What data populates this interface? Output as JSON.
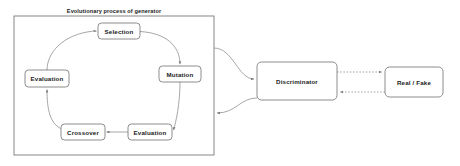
{
  "diagram": {
    "title": "Evolutionary process of generator",
    "group": {
      "label": "Evolutionary process of generator",
      "x": 14,
      "y": 16,
      "w": 200,
      "h": 139
    },
    "nodes": [
      {
        "id": "selection",
        "label": "Selection",
        "cx": 119,
        "cy": 31,
        "w": 42,
        "h": 16
      },
      {
        "id": "mutation",
        "label": "Mutation",
        "cx": 180,
        "cy": 74,
        "w": 42,
        "h": 16
      },
      {
        "id": "evaluation_bottom",
        "label": "Evaluation",
        "cx": 150,
        "cy": 132,
        "w": 44,
        "h": 16
      },
      {
        "id": "crossover",
        "label": "Crossover",
        "cx": 83,
        "cy": 132,
        "w": 44,
        "h": 16
      },
      {
        "id": "evaluation_left",
        "label": "Evaluation",
        "cx": 47,
        "cy": 79,
        "w": 44,
        "h": 17
      },
      {
        "id": "discriminator",
        "label": "Discriminator",
        "cx": 297,
        "cy": 81,
        "w": 80,
        "h": 38
      },
      {
        "id": "real_fake",
        "label": "Real / Fake",
        "cx": 414,
        "cy": 82,
        "w": 58,
        "h": 30
      }
    ],
    "edges": [
      {
        "id": "evaluation-left-to-selection",
        "from": "evaluation_left",
        "to": "selection",
        "style": "solid"
      },
      {
        "id": "selection-to-mutation",
        "from": "selection",
        "to": "mutation",
        "style": "solid"
      },
      {
        "id": "mutation-to-evaluation",
        "from": "mutation",
        "to": "evaluation_bottom",
        "style": "solid"
      },
      {
        "id": "evaluation-to-crossover",
        "from": "evaluation_bottom",
        "to": "crossover",
        "style": "solid"
      },
      {
        "id": "crossover-to-evaluation-left",
        "from": "crossover",
        "to": "evaluation_left",
        "style": "solid"
      },
      {
        "id": "generator-to-discriminator",
        "from": "group",
        "to": "discriminator",
        "style": "solid"
      },
      {
        "id": "discriminator-to-generator",
        "from": "discriminator",
        "to": "group",
        "style": "solid"
      },
      {
        "id": "discriminator-to-real-fake",
        "from": "discriminator",
        "to": "real_fake",
        "style": "dotted"
      },
      {
        "id": "real-fake-to-discriminator",
        "from": "real_fake",
        "to": "discriminator",
        "style": "dotted"
      }
    ],
    "colors": {
      "background": "#ffffff",
      "box_stroke": "#6f6f6f",
      "group_stroke": "#7a7a7a",
      "edge_stroke": "#8a8a8a",
      "text": "#1a1a1a"
    }
  }
}
